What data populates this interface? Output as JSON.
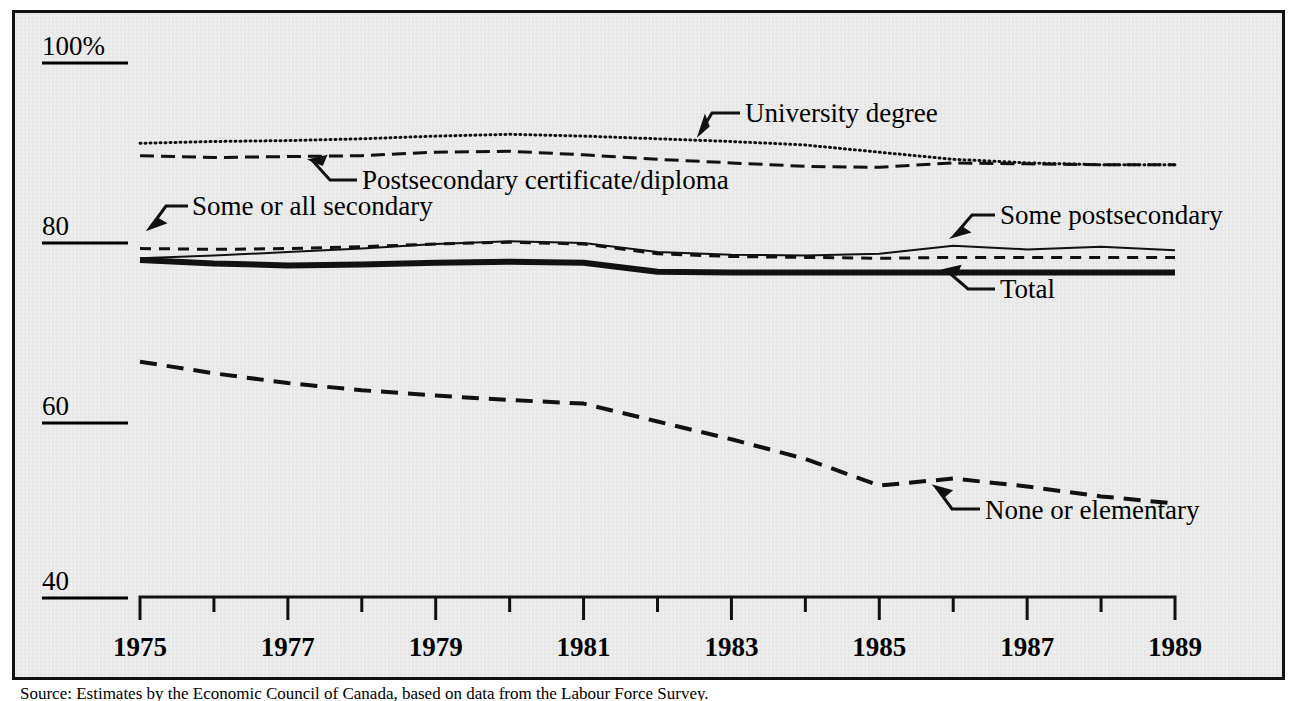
{
  "figure": {
    "background_color": "#e9e9e9",
    "frame_color": "#111111",
    "source_note": "Source:  Estimates by the Economic Council of Canada, based on data from the Labour Force Survey."
  },
  "chart_data": {
    "type": "line",
    "title": "",
    "xlabel": "",
    "ylabel": "",
    "grid": false,
    "legend": "inline-annotations",
    "xlim": [
      1975,
      1989
    ],
    "ylim": [
      40,
      100
    ],
    "x": [
      1975,
      1976,
      1977,
      1978,
      1979,
      1980,
      1981,
      1982,
      1983,
      1984,
      1985,
      1986,
      1987,
      1988,
      1989
    ],
    "x_tick_labels": [
      "1975",
      "",
      "1977",
      "",
      "1979",
      "",
      "1981",
      "",
      "1983",
      "",
      "1985",
      "",
      "1987",
      "",
      "1989"
    ],
    "x_major_labels": [
      "1975",
      "1977",
      "1979",
      "1981",
      "1983",
      "1985",
      "1987",
      "1989"
    ],
    "y_ticks": [
      40,
      60,
      80,
      100
    ],
    "y_tick_labels": [
      "40",
      "60",
      "80",
      "100%"
    ],
    "series": [
      {
        "name": "University degree",
        "style": "dotted",
        "stroke_width": 3,
        "dash": "1 4",
        "label_anchor_year": 1980.6,
        "values": [
          91.0,
          91.2,
          91.3,
          91.5,
          91.8,
          92.0,
          91.8,
          91.5,
          91.2,
          90.8,
          90.0,
          89.2,
          88.8,
          88.6,
          88.6
        ]
      },
      {
        "name": "Postsecondary certificate/diploma",
        "style": "long-dash",
        "stroke_width": 3,
        "dash": "14 7",
        "label_anchor_year": 1978.2,
        "values": [
          89.6,
          89.4,
          89.5,
          89.6,
          90.0,
          90.1,
          89.7,
          89.2,
          88.8,
          88.4,
          88.3,
          88.8,
          88.7,
          88.6,
          88.6
        ]
      },
      {
        "name": "Some or all secondary",
        "style": "medium-dash",
        "stroke_width": 3,
        "dash": "11 8",
        "label_anchor_year": 1975.6,
        "values": [
          79.2,
          79.1,
          79.2,
          79.4,
          79.7,
          79.9,
          79.7,
          78.6,
          78.3,
          78.2,
          78.1,
          78.2,
          78.2,
          78.2,
          78.2
        ]
      },
      {
        "name": "Some postsecondary",
        "style": "thin-solid",
        "stroke_width": 2,
        "dash": "none",
        "label_anchor_year": 1985.4,
        "values": [
          78.1,
          78.4,
          78.8,
          79.2,
          79.7,
          80.0,
          79.8,
          78.8,
          78.5,
          78.4,
          78.6,
          79.5,
          79.1,
          79.4,
          79.0
        ]
      },
      {
        "name": "Total",
        "style": "thick-solid",
        "stroke_width": 6,
        "dash": "none",
        "label_anchor_year": 1983.1,
        "values": [
          77.9,
          77.5,
          77.3,
          77.4,
          77.6,
          77.7,
          77.6,
          76.6,
          76.5,
          76.5,
          76.5,
          76.5,
          76.5,
          76.5,
          76.5
        ]
      },
      {
        "name": "None or elementary",
        "style": "long-dash",
        "stroke_width": 4,
        "dash": "17 10",
        "label_anchor_year": 1985.6,
        "values": [
          66.5,
          65.2,
          64.1,
          63.3,
          62.7,
          62.2,
          61.8,
          59.8,
          57.8,
          55.6,
          52.6,
          53.4,
          52.5,
          51.4,
          50.6
        ]
      }
    ],
    "annotations": [
      {
        "text": "University degree",
        "x": 745,
        "y": 115
      },
      {
        "text": "Postsecondary certificate/diploma",
        "x": 362,
        "y": 186
      },
      {
        "text": "Some or all secondary",
        "x": 192,
        "y": 213
      },
      {
        "text": "Some postsecondary",
        "x": 1000,
        "y": 222
      },
      {
        "text": "Total",
        "x": 1000,
        "y": 295
      },
      {
        "text": "None or elementary",
        "x": 985,
        "y": 515
      }
    ]
  }
}
